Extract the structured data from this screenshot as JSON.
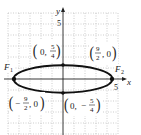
{
  "figure": {
    "type": "ellipse-graph",
    "equation_shape": "horizontal ellipse centered at origin",
    "axes": {
      "x_label": "x",
      "y_label": "y",
      "x_tick_label": "5",
      "y_tick_label": "5",
      "unit_px": 11,
      "origin_px": [
        63,
        79
      ]
    },
    "grid": {
      "style": "dotted",
      "color": "#b8b8b8",
      "x_range": [
        -5,
        5
      ],
      "y_range": [
        -5,
        5
      ]
    },
    "ellipse": {
      "a": 4.5,
      "b": 1.25,
      "stroke": "#111111"
    },
    "points": [
      {
        "name": "left-vertex",
        "x": -4.5,
        "y": 0,
        "label_num": "9",
        "label_den": "2",
        "label_sign": "−",
        "label_pre": "(",
        "label_post": ", 0)"
      },
      {
        "name": "right-vertex",
        "x": 4.5,
        "y": 0,
        "label_num": "9",
        "label_den": "2",
        "label_sign": "",
        "label_pre": "(",
        "label_post": ", 0)"
      },
      {
        "name": "top-covertex",
        "x": 0,
        "y": 1.25,
        "label_num": "5",
        "label_den": "4",
        "label_sign": "",
        "label_pre": "(0, ",
        "label_post": ")"
      },
      {
        "name": "bottom-covertex",
        "x": 0,
        "y": -1.25,
        "label_num": "5",
        "label_den": "4",
        "label_sign": "−",
        "label_pre": "(0, ",
        "label_post": ")"
      }
    ],
    "foci": [
      {
        "name": "F1",
        "label": "F",
        "sub": "1"
      },
      {
        "name": "F2",
        "label": "F",
        "sub": "2"
      }
    ]
  }
}
